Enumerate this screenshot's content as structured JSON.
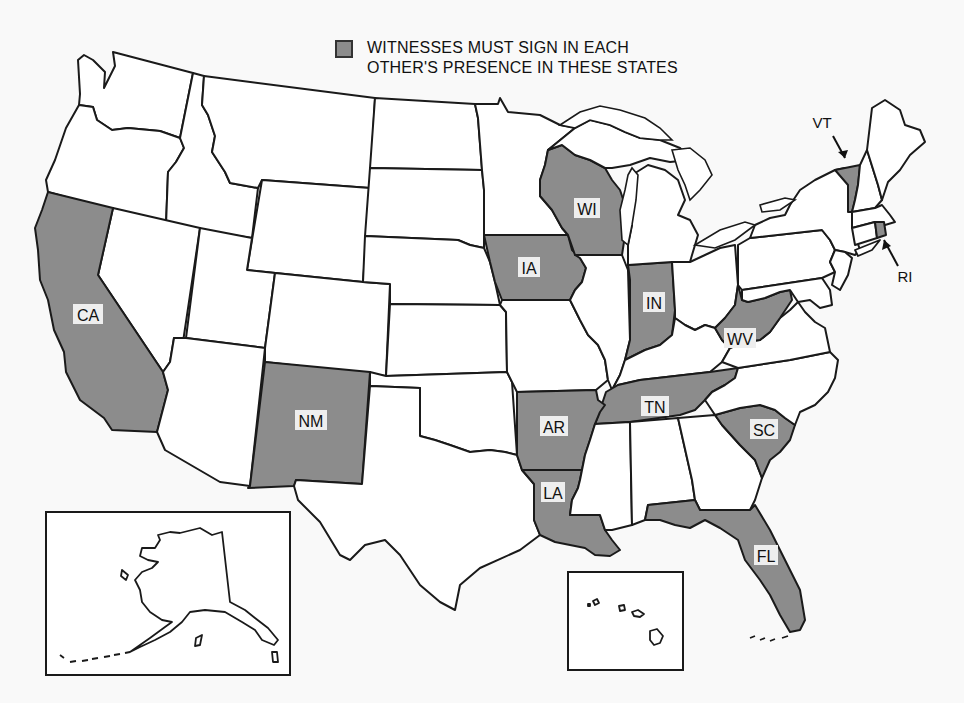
{
  "legend": {
    "swatch_color": "#8c8c8c",
    "line1": "WITNESSES MUST SIGN IN EACH",
    "line2": "OTHER'S PRESENCE IN THESE STATES"
  },
  "colors": {
    "highlight": "#8c8c8c",
    "default_state": "#ffffff",
    "border": "#1a1a1a",
    "background": "#f9f9f9"
  },
  "highlighted_states": [
    {
      "abbr": "CA",
      "name": "California"
    },
    {
      "abbr": "NM",
      "name": "New Mexico"
    },
    {
      "abbr": "IA",
      "name": "Iowa"
    },
    {
      "abbr": "WI",
      "name": "Wisconsin"
    },
    {
      "abbr": "IN",
      "name": "Indiana"
    },
    {
      "abbr": "WV",
      "name": "West Virginia"
    },
    {
      "abbr": "AR",
      "name": "Arkansas"
    },
    {
      "abbr": "TN",
      "name": "Tennessee"
    },
    {
      "abbr": "LA",
      "name": "Louisiana"
    },
    {
      "abbr": "SC",
      "name": "South Carolina"
    },
    {
      "abbr": "FL",
      "name": "Florida"
    },
    {
      "abbr": "VT",
      "name": "Vermont"
    },
    {
      "abbr": "RI",
      "name": "Rhode Island"
    }
  ],
  "labels": {
    "CA": "CA",
    "NM": "NM",
    "IA": "IA",
    "WI": "WI",
    "IN": "IN",
    "WV": "WV",
    "AR": "AR",
    "TN": "TN",
    "LA": "LA",
    "SC": "SC",
    "FL": "FL",
    "VT": "VT",
    "RI": "RI"
  },
  "insets": [
    "Alaska",
    "Hawaii"
  ]
}
